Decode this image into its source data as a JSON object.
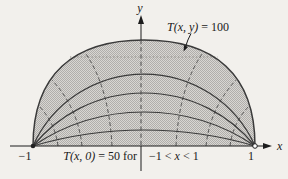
{
  "figure": {
    "labels": {
      "y_axis": "y",
      "x_axis": "x",
      "top_condition": {
        "fn": "T(x, y)",
        "eq": " = 100"
      },
      "bottom_condition_left": {
        "fn": "T(x, 0)",
        "eq": " = 50 for"
      },
      "bottom_condition_right": {
        "pre": "−1 < ",
        "var": "x",
        "post": " < 1"
      },
      "tick_left": "−1",
      "tick_right": "1"
    },
    "region": {
      "x_range": [
        -1,
        1
      ],
      "boundary_temperature": 100,
      "diameter_temperature": 50,
      "solid_isotherm_arcs": 4,
      "dashed_flux_lines": 6,
      "dotted_chord": 1
    },
    "colors": {
      "background": "#f2f0ec",
      "stipple_light": "#d8d6d2",
      "stipple_dark": "#b0aeab",
      "curve": "#3a3a3a",
      "axis": "#1c1c1c",
      "dashed": "#4a4a4a",
      "dotted": "#8f8d88"
    }
  }
}
